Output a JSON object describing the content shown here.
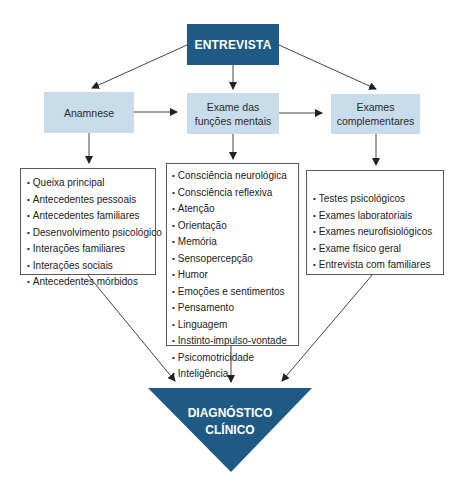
{
  "diagram": {
    "root": {
      "label": "ENTREVISTA"
    },
    "stages": [
      {
        "label_line1": "Anamnese",
        "label_line2": ""
      },
      {
        "label_line1": "Exame das",
        "label_line2": "funções mentais"
      },
      {
        "label_line1": "Exames",
        "label_line2": "complementares"
      }
    ],
    "lists": [
      {
        "items": [
          "Queixa principal",
          "Antecedentes pessoais",
          "Antecedentes familiares",
          "Desenvolvimento psicológico",
          "Interações familiares",
          "Interações sociais",
          "Antecedentes mórbidos"
        ]
      },
      {
        "items": [
          "Consciência neurológica",
          "Consciência reflexiva",
          "Atenção",
          "Orientação",
          "Memória",
          "Sensopercepção",
          "Humor",
          "Emoções e sentimentos",
          "Pensamento",
          "Linguagem",
          "Instinto-impulso-vontade",
          "Psicomotricidade",
          "Inteligência"
        ]
      },
      {
        "items": [
          "Testes psicológicos",
          "Exames laboratoriais",
          "Exames neurofisiológicos",
          "Exame físico geral",
          "Entrevista com familiares"
        ]
      }
    ],
    "result": {
      "label_line1": "DIAGNÓSTICO",
      "label_line2": "CLÍNICO"
    },
    "colors": {
      "dark": "#1f5a85",
      "light": "#c9dce9",
      "line": "#444444"
    }
  }
}
